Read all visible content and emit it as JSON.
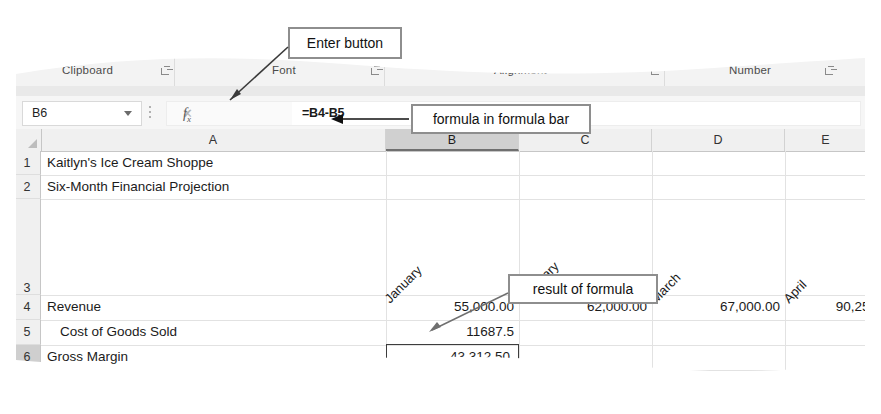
{
  "ribbon": {
    "groups": [
      {
        "label": "Clipboard",
        "x": 48
      },
      {
        "label": "Font",
        "x": 258
      },
      {
        "label": "Alignment",
        "x": 480
      },
      {
        "label": "Number",
        "x": 715
      }
    ],
    "dialog_launcher_icon": "dialog-box-launcher-icon"
  },
  "formula_bar": {
    "name_box_value": "B6",
    "name_box_dropdown_icon": "chevron-down-icon",
    "cancel_icon": "close-icon",
    "enter_icon": "check-icon",
    "insert_function_icon": "fx-icon",
    "formula_value": "=B4-B5"
  },
  "grid": {
    "columns": [
      {
        "label": "A",
        "left": 27,
        "width": 345,
        "selected": false
      },
      {
        "label": "B",
        "left": 372,
        "width": 133,
        "selected": true
      },
      {
        "label": "C",
        "left": 505,
        "width": 133,
        "selected": false
      },
      {
        "label": "D",
        "left": 638,
        "width": 133,
        "selected": false
      },
      {
        "label": "E",
        "left": 771,
        "width": 82,
        "selected": false
      }
    ],
    "rows": [
      {
        "label": "1",
        "top": 22,
        "height": 24,
        "selected": false
      },
      {
        "label": "2",
        "top": 46,
        "height": 24,
        "selected": false
      },
      {
        "label": "3",
        "top": 70,
        "height": 96,
        "selected": false
      },
      {
        "label": "4",
        "top": 166,
        "height": 25,
        "selected": false
      },
      {
        "label": "5",
        "top": 191,
        "height": 25,
        "selected": false
      },
      {
        "label": "6",
        "top": 216,
        "height": 25,
        "selected": true
      },
      {
        "label": "7",
        "top": 241,
        "height": 8,
        "selected": false
      }
    ],
    "cells": {
      "a1": "Kaitlyn's Ice Cream Shoppe",
      "a2": "Six-Month Financial Projection",
      "a4": "Revenue",
      "a5": "Cost of Goods Sold",
      "a6": "Gross Margin",
      "b3": "January",
      "c3": "February",
      "d3": "March",
      "e3": "April",
      "b4": "55,000.00",
      "c4": "62,000.00",
      "d4": "67,000.00",
      "e4": "90,250",
      "b5": "11687.5",
      "b6": "43,312.50"
    },
    "active_cell": "B6"
  },
  "callouts": {
    "enter_button": "Enter button",
    "formula_in_bar": "formula in formula bar",
    "result_of_formula": "result of formula"
  },
  "colors": {
    "callout_border": "#8e8e8e",
    "ribbon_bg": "#f3f3f3",
    "header_bg": "#f0f0f0",
    "selected_header_bg": "#d0d0d0",
    "gridline": "#e2e2e2",
    "selection_border": "#3d3d3d"
  }
}
